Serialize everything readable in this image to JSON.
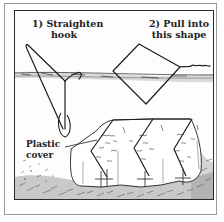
{
  "figure": {
    "type": "instructional-illustration",
    "steps": [
      {
        "number": "1)",
        "line1": "1) Straighten",
        "line2": "hook"
      },
      {
        "number": "2)",
        "line1": "2) Pull into",
        "line2": "this shape"
      }
    ],
    "callouts": [
      {
        "line1": "Plastic",
        "line2": "cover"
      }
    ],
    "colors": {
      "ink": "#1e1e1e",
      "border": "#2a2a2a",
      "outer_border": "#9a9a9a",
      "background": "#ffffff",
      "ground_hatch": "#555555"
    }
  }
}
